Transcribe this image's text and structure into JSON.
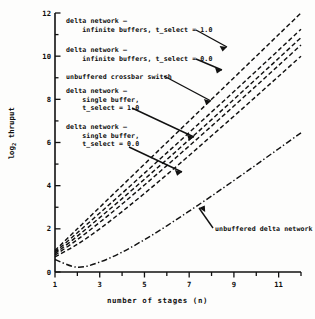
{
  "figure": {
    "title": "",
    "y_axis_label_main": "log",
    "y_axis_label_sub": "2",
    "y_axis_label_rest": " thruput",
    "x_axis_label": "number of stages (n)"
  },
  "annotations": [
    {
      "id": "delta-infinite-1",
      "text": "delta network —\n    infinite buffers, t_select = 1.0"
    },
    {
      "id": "delta-infinite-0",
      "text": "delta network —\n    infinite buffers, t_select = 0.0"
    },
    {
      "id": "crossbar",
      "text": "unbuffered crossbar switch"
    },
    {
      "id": "delta-single-1",
      "text": "delta network —\n    single buffer,\n    t_select = 1.0"
    },
    {
      "id": "delta-single-0",
      "text": "delta network —\n    single buffer,\n    t_select = 0.0"
    },
    {
      "id": "unbuffered-delta",
      "text": "unbuffered delta network"
    }
  ],
  "axis_ticks": {
    "y_labels": [
      "0",
      "2",
      "4",
      "6",
      "8",
      "10",
      "12"
    ],
    "y_values": [
      0,
      2,
      4,
      6,
      8,
      10,
      12
    ],
    "x_labels": [
      "1",
      "3",
      "5",
      "7",
      "9",
      "11"
    ],
    "x_values": [
      1,
      3,
      5,
      7,
      9,
      11
    ]
  },
  "chart_data": {
    "type": "line",
    "title": "",
    "xlabel": "number of stages (n)",
    "ylabel": "log_2 thruput",
    "xlim": [
      1,
      12
    ],
    "ylim": [
      0,
      12
    ],
    "grid": false,
    "legend": "inline-annotations",
    "x": [
      1,
      2,
      3,
      4,
      5,
      6,
      7,
      8,
      9,
      10,
      11,
      12
    ],
    "series": [
      {
        "name": "unbuffered crossbar switch",
        "style": "dashed",
        "values": [
          1.0,
          2.0,
          3.0,
          4.0,
          5.0,
          6.0,
          7.0,
          8.0,
          9.0,
          10.0,
          11.0,
          12.0
        ]
      },
      {
        "name": "delta network — infinite buffers, t_select = 1.0",
        "style": "dashed",
        "values": [
          0.92,
          1.82,
          2.73,
          3.65,
          4.58,
          5.52,
          6.46,
          7.41,
          8.36,
          9.32,
          10.28,
          11.25
        ]
      },
      {
        "name": "delta network — infinite buffers, t_select = 0.0",
        "style": "dashed",
        "values": [
          0.85,
          1.66,
          2.52,
          3.4,
          4.3,
          5.21,
          6.13,
          7.06,
          8.0,
          8.95,
          9.9,
          10.86
        ]
      },
      {
        "name": "delta network — single buffer, t_select = 1.0",
        "style": "dashed",
        "values": [
          0.78,
          1.5,
          2.3,
          3.15,
          4.03,
          4.93,
          5.84,
          6.76,
          7.69,
          8.63,
          9.57,
          10.52
        ]
      },
      {
        "name": "delta network — single buffer, t_select = 0.0",
        "style": "dashed",
        "values": [
          0.7,
          1.28,
          2.0,
          2.8,
          3.64,
          4.51,
          5.4,
          6.31,
          7.22,
          8.14,
          9.07,
          10.0
        ]
      },
      {
        "name": "unbuffered delta network",
        "style": "dash-dot",
        "values": [
          0.58,
          0.22,
          0.46,
          0.92,
          1.5,
          2.14,
          2.82,
          3.52,
          4.24,
          4.97,
          5.71,
          6.45
        ]
      }
    ]
  }
}
